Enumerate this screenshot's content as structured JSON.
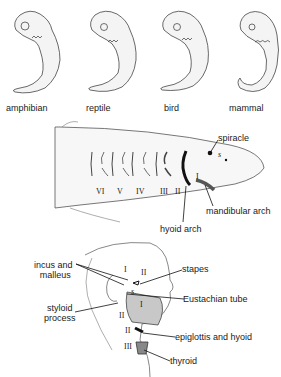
{
  "embryos": [
    {
      "label": "amphibian"
    },
    {
      "label": "reptile"
    },
    {
      "label": "bird"
    },
    {
      "label": "mammal"
    }
  ],
  "shark": {
    "arch_numerals": [
      "VI",
      "V",
      "IV",
      "III",
      "II",
      "I"
    ],
    "spiracle_mark": "s",
    "labels": {
      "spiracle": "spiracle",
      "mandibular_arch": "mandibular arch",
      "hyoid_arch": "hyoid arch"
    }
  },
  "human": {
    "numerals": {
      "ear_I": "I",
      "ear_II": "II",
      "s": "s",
      "jaw_I": "I",
      "styloid_II": "II",
      "hyoid_II": "II",
      "thyroid_III": "III"
    },
    "labels": {
      "incus_malleus_1": "incus and",
      "incus_malleus_2": "malleus",
      "styloid_1": "styloid",
      "styloid_2": "process",
      "stapes": "stapes",
      "eustachian": "Eustachian tube",
      "epiglottis": "epiglottis and hyoid",
      "thyroid": "thyroid"
    }
  }
}
